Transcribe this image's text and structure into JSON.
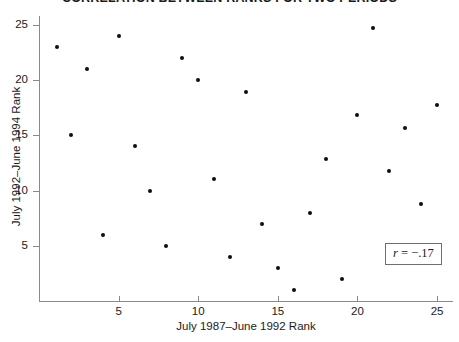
{
  "chart_data": {
    "type": "scatter",
    "title": "CORRELATION BETWEEN RANKS FOR TWO PERIODS",
    "xlabel": "July 1987–June 1992 Rank",
    "ylabel": "July 1992–June 1994 Rank",
    "xlim": [
      0,
      26
    ],
    "ylim": [
      0,
      25.8
    ],
    "xticks": [
      5,
      10,
      15,
      20,
      25
    ],
    "yticks": [
      5,
      10,
      15,
      20,
      25
    ],
    "xticklabels": [
      "5",
      "10",
      "15",
      "20",
      "25"
    ],
    "yticklabels": [
      "5",
      "10",
      "15",
      "20",
      "25"
    ],
    "grid": false,
    "legend": null,
    "annotations": [
      {
        "name": "correlation",
        "text": "r = −.17",
        "value": -0.17,
        "symbol": "r",
        "boxed": true
      }
    ],
    "marker": {
      "shape": "circle",
      "color": "#0d0d0d",
      "size": 4
    },
    "points": [
      {
        "x": 1.1,
        "y": 23.0
      },
      {
        "x": 2.0,
        "y": 15.0
      },
      {
        "x": 3.0,
        "y": 21.0
      },
      {
        "x": 4.0,
        "y": 6.0
      },
      {
        "x": 5.0,
        "y": 24.0
      },
      {
        "x": 6.0,
        "y": 14.0
      },
      {
        "x": 7.0,
        "y": 10.0
      },
      {
        "x": 8.0,
        "y": 5.0
      },
      {
        "x": 9.0,
        "y": 22.0
      },
      {
        "x": 10.0,
        "y": 20.0
      },
      {
        "x": 11.0,
        "y": 11.0
      },
      {
        "x": 12.0,
        "y": 4.0
      },
      {
        "x": 13.0,
        "y": 18.9
      },
      {
        "x": 14.0,
        "y": 7.0
      },
      {
        "x": 15.0,
        "y": 3.0
      },
      {
        "x": 16.0,
        "y": 1.0
      },
      {
        "x": 17.0,
        "y": 8.0
      },
      {
        "x": 18.0,
        "y": 12.9
      },
      {
        "x": 19.0,
        "y": 2.0
      },
      {
        "x": 20.0,
        "y": 16.8
      },
      {
        "x": 21.0,
        "y": 24.7
      },
      {
        "x": 22.0,
        "y": 11.8
      },
      {
        "x": 23.0,
        "y": 15.7
      },
      {
        "x": 24.0,
        "y": 8.8
      },
      {
        "x": 25.0,
        "y": 17.7
      }
    ]
  }
}
